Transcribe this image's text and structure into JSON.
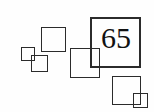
{
  "figure": {
    "background_color": "#fefefe",
    "stroke_color": "#2b2b2b",
    "text_color": "#111111",
    "width": 154,
    "height": 112,
    "label_value": "65",
    "shape_count": 6
  },
  "shapes": [
    {
      "name": "square-tiny-left",
      "x": 21,
      "y": 47,
      "size": 14,
      "stroke": 1
    },
    {
      "name": "square-small-left-lower",
      "x": 31,
      "y": 55,
      "size": 17,
      "stroke": 1
    },
    {
      "name": "square-medium-upper",
      "x": 41,
      "y": 27,
      "size": 25,
      "stroke": 1
    },
    {
      "name": "square-medium-center",
      "x": 70,
      "y": 48,
      "size": 30,
      "stroke": 1
    },
    {
      "name": "square-large-labeled",
      "x": 90,
      "y": 17,
      "size": 51,
      "stroke": 2
    },
    {
      "name": "square-medium-lower",
      "x": 112,
      "y": 76,
      "size": 29,
      "stroke": 1
    },
    {
      "name": "square-tiny-lower-right",
      "x": 133,
      "y": 93,
      "size": 15,
      "stroke": 1
    }
  ],
  "label": {
    "text": "65",
    "x": 101,
    "y": 23,
    "font_size": 30
  }
}
